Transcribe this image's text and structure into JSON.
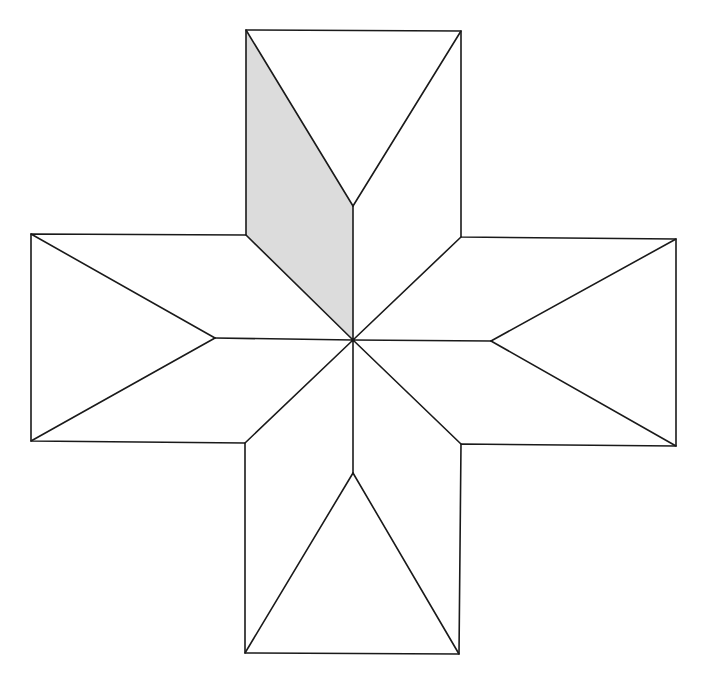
{
  "figure": {
    "colors": {
      "background": "#ffffff",
      "stroke": "#1a1a1a",
      "shade": "#dcdcdc"
    },
    "center": [
      353,
      340
    ],
    "shaded_region": {
      "name": "shaded-rhombus-top-left",
      "points": [
        [
          246,
          30
        ],
        [
          353,
          206
        ],
        [
          353,
          340
        ],
        [
          246,
          235
        ]
      ]
    },
    "outline": {
      "points": [
        [
          246,
          30
        ],
        [
          461,
          31
        ],
        [
          461,
          237
        ],
        [
          676,
          239
        ],
        [
          676,
          446
        ],
        [
          461,
          444
        ],
        [
          459,
          654
        ],
        [
          245,
          653
        ],
        [
          245,
          443
        ],
        [
          31,
          441
        ],
        [
          31,
          234
        ],
        [
          246,
          235
        ]
      ]
    },
    "segments": [
      {
        "name": "top-square-left-diagonal",
        "from": [
          246,
          30
        ],
        "to": [
          353,
          206
        ]
      },
      {
        "name": "top-square-right-diagonal",
        "from": [
          461,
          31
        ],
        "to": [
          353,
          206
        ]
      },
      {
        "name": "top-vertical-spoke",
        "from": [
          353,
          206
        ],
        "to": [
          353,
          340
        ]
      },
      {
        "name": "left-square-top-diagonal",
        "from": [
          31,
          234
        ],
        "to": [
          215,
          338
        ]
      },
      {
        "name": "left-square-bottom-diagonal",
        "from": [
          31,
          441
        ],
        "to": [
          215,
          338
        ]
      },
      {
        "name": "left-horizontal-spoke",
        "from": [
          215,
          338
        ],
        "to": [
          353,
          340
        ]
      },
      {
        "name": "right-square-top-diagonal",
        "from": [
          676,
          239
        ],
        "to": [
          491,
          341
        ]
      },
      {
        "name": "right-square-bottom-diagonal",
        "from": [
          676,
          446
        ],
        "to": [
          491,
          341
        ]
      },
      {
        "name": "right-horizontal-spoke",
        "from": [
          491,
          341
        ],
        "to": [
          353,
          340
        ]
      },
      {
        "name": "bottom-square-left-diagonal",
        "from": [
          245,
          653
        ],
        "to": [
          353,
          473
        ]
      },
      {
        "name": "bottom-square-right-diagonal",
        "from": [
          459,
          654
        ],
        "to": [
          353,
          473
        ]
      },
      {
        "name": "bottom-vertical-spoke",
        "from": [
          353,
          473
        ],
        "to": [
          353,
          340
        ]
      },
      {
        "name": "diagonal-spoke-top-left",
        "from": [
          246,
          235
        ],
        "to": [
          353,
          340
        ]
      },
      {
        "name": "diagonal-spoke-top-right",
        "from": [
          461,
          237
        ],
        "to": [
          353,
          340
        ]
      },
      {
        "name": "diagonal-spoke-bottom-left",
        "from": [
          245,
          443
        ],
        "to": [
          353,
          340
        ]
      },
      {
        "name": "diagonal-spoke-bottom-right",
        "from": [
          461,
          444
        ],
        "to": [
          353,
          340
        ]
      }
    ]
  }
}
